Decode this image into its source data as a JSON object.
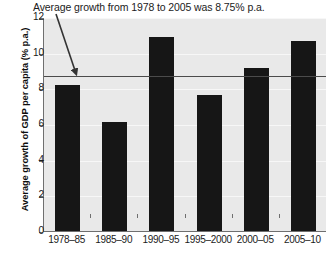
{
  "chart_data": {
    "type": "bar",
    "title": "Average growth from 1978 to 2005 was 8.75% p.a.",
    "xlabel": "",
    "ylabel": "Average growth of GDP per capita (% p.a.)",
    "categories": [
      "1978–85",
      "1985–90",
      "1990–95",
      "1995–2000",
      "2000–05",
      "2005–10"
    ],
    "values": [
      8.2,
      6.1,
      10.9,
      7.6,
      9.15,
      10.65
    ],
    "ylim": [
      0,
      12
    ],
    "yticks": [
      0,
      2,
      4,
      6,
      8,
      10,
      12
    ],
    "ytick_labels": [
      "0",
      "2",
      "4",
      "6",
      "8",
      "10",
      "12"
    ],
    "grid": true,
    "legend": "none",
    "bar_color": "#161616",
    "plot_background": "#e9e9e9",
    "annotations": [
      {
        "name": "average-line",
        "type": "hline",
        "value": 8.75,
        "color": "#4b4b4b"
      },
      {
        "name": "title-arrow",
        "type": "arrow",
        "color": "#333333",
        "points_to": "average-line"
      }
    ]
  }
}
